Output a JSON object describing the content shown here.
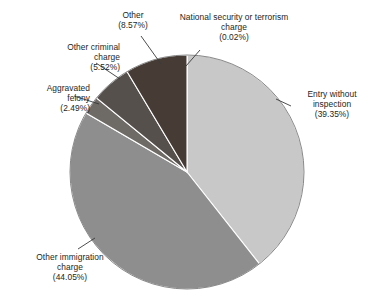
{
  "chart_data": {
    "type": "pie",
    "title": "",
    "subtitle": "",
    "xlabel": "",
    "ylabel": "",
    "legend_position": "callout-labels",
    "grid": false,
    "units": "percent",
    "start_angle_deg": 0,
    "direction": "clockwise",
    "categories": [
      "National security or terrorism charge",
      "Entry without inspection",
      "Other immigration charge",
      "Aggravated felony",
      "Other criminal charge",
      "Other"
    ],
    "values": [
      0.02,
      39.35,
      44.05,
      2.49,
      5.52,
      8.57
    ],
    "slices": [
      {
        "name": "national-security-or-terrorism-charge",
        "label_line1": "National security or terrorism",
        "label_line2": "charge",
        "percent_text": "(0.02%)",
        "value": 0.02,
        "color": "#3f3731"
      },
      {
        "name": "entry-without-inspection",
        "label_line1": "Entry without",
        "label_line2": "inspection",
        "percent_text": "(39.35%)",
        "value": 39.35,
        "color": "#c8c8c8"
      },
      {
        "name": "other-immigration-charge",
        "label_line1": "Other immigration",
        "label_line2": "charge",
        "percent_text": "(44.05%)",
        "value": 44.05,
        "color": "#8e8e8e"
      },
      {
        "name": "aggravated-felony",
        "label_line1": "Aggravated",
        "label_line2": "felony",
        "percent_text": "(2.49%)",
        "value": 2.49,
        "color": "#6e6a66"
      },
      {
        "name": "other-criminal-charge",
        "label_line1": "Other criminal",
        "label_line2": "charge",
        "percent_text": "(5.52%)",
        "value": 5.52,
        "color": "#55504c"
      },
      {
        "name": "other",
        "label_line1": "Other",
        "label_line2": "",
        "percent_text": "(8.57%)",
        "value": 8.57,
        "color": "#463c35"
      }
    ]
  },
  "colors": {
    "background": "#ffffff",
    "text": "#231f1e",
    "leader_line": "#3a3a3a",
    "slice_outline": "#ffffff"
  }
}
